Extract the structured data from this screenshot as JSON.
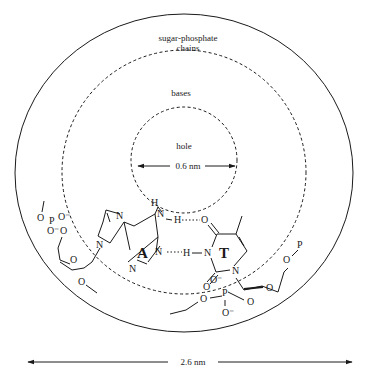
{
  "diagram": {
    "regions": {
      "outer": "sugar-phosphate",
      "outer_line2": "chains",
      "middle": "bases",
      "inner": "hole"
    },
    "dimensions": {
      "hole_diameter": "0.6 nm",
      "total_diameter": "2.6 nm"
    },
    "bases": {
      "left": "A",
      "right": "T"
    },
    "atoms": {
      "N": "N",
      "H": "H",
      "O": "O",
      "P": "P",
      "O_minus": "O⁻"
    },
    "colors": {
      "ink": "#1a1a1a",
      "background": "#ffffff"
    }
  }
}
